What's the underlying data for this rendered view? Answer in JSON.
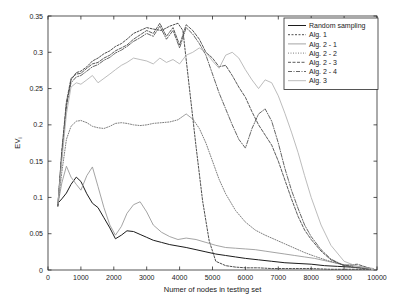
{
  "chart_data": {
    "type": "line",
    "title": "",
    "xlabel": "Numer of nodes in testing set",
    "ylabel": "EV",
    "ylabel_sub": "i",
    "xlim": [
      0,
      10000
    ],
    "ylim": [
      0,
      0.35
    ],
    "xticks": [
      0,
      1000,
      2000,
      3000,
      4000,
      5000,
      6000,
      7000,
      8000,
      9000,
      10000
    ],
    "xtick_labels": [
      "0",
      "1000",
      "2000",
      "3000",
      "4000",
      "5000",
      "6000",
      "7000",
      "8000",
      "9000",
      "10000"
    ],
    "yticks": [
      0,
      0.05,
      0.1,
      0.15,
      0.2,
      0.25,
      0.3,
      0.35
    ],
    "ytick_labels": [
      "0",
      "0.05",
      "0.1",
      "0.15",
      "0.2",
      "0.25",
      "0.3",
      "0.35"
    ],
    "grid": false,
    "legend_position": "top-right",
    "series": [
      {
        "name": "Random sampling",
        "color": "#1c1c1c",
        "dash": "none",
        "width": 1.0,
        "x": [
          300,
          420,
          560,
          700,
          860,
          1000,
          1180,
          1350,
          1520,
          1700,
          1880,
          2050,
          2230,
          2400,
          2600,
          2800,
          3000,
          3200,
          3450,
          3700,
          3950,
          4200,
          4500,
          4800,
          5100,
          5400,
          5700,
          6000,
          6400,
          6800,
          7200,
          7600,
          8000,
          8400,
          8800,
          9200,
          9500,
          9800
        ],
        "y": [
          0.092,
          0.098,
          0.106,
          0.118,
          0.128,
          0.122,
          0.105,
          0.092,
          0.086,
          0.072,
          0.058,
          0.043,
          0.048,
          0.054,
          0.053,
          0.049,
          0.045,
          0.041,
          0.038,
          0.035,
          0.033,
          0.031,
          0.028,
          0.025,
          0.022,
          0.02,
          0.018,
          0.016,
          0.014,
          0.012,
          0.01,
          0.009,
          0.008,
          0.006,
          0.005,
          0.004,
          0.003,
          0.002
        ]
      },
      {
        "name": "Alg. 1",
        "color": "#3a3a3a",
        "dash": "2,1.5",
        "width": 0.9,
        "x": [
          300,
          420,
          560,
          700,
          860,
          1000,
          1180,
          1350,
          1520,
          1700,
          1880,
          2050,
          2230,
          2400,
          2600,
          2800,
          3000,
          3200,
          3450,
          3700,
          3950,
          4100,
          4300,
          4500,
          4700,
          4900,
          5100,
          5400,
          5700,
          6000,
          6400,
          6800,
          7200,
          7600,
          8000,
          8600,
          9200,
          9800
        ],
        "y": [
          0.088,
          0.16,
          0.225,
          0.262,
          0.272,
          0.274,
          0.28,
          0.288,
          0.292,
          0.298,
          0.302,
          0.308,
          0.312,
          0.318,
          0.326,
          0.33,
          0.334,
          0.332,
          0.33,
          0.336,
          0.34,
          0.33,
          0.25,
          0.17,
          0.095,
          0.04,
          0.012,
          0.006,
          0.004,
          0.003,
          0.003,
          0.002,
          0.002,
          0.002,
          0.002,
          0.001,
          0.001,
          0.001
        ]
      },
      {
        "name": "Alg. 2 - 1",
        "color": "#9a9a9a",
        "dash": "none",
        "width": 0.9,
        "x": [
          300,
          420,
          560,
          700,
          860,
          1000,
          1180,
          1350,
          1520,
          1700,
          1880,
          2050,
          2230,
          2400,
          2600,
          2800,
          3000,
          3200,
          3450,
          3700,
          3950,
          4200,
          4500,
          4800,
          5100,
          5400,
          5700,
          6000,
          6300,
          6600,
          6900,
          7200,
          7500,
          7800,
          8100,
          8500,
          8900,
          9300,
          9600,
          9900
        ],
        "y": [
          0.09,
          0.12,
          0.143,
          0.128,
          0.118,
          0.11,
          0.13,
          0.142,
          0.115,
          0.086,
          0.062,
          0.048,
          0.06,
          0.078,
          0.09,
          0.094,
          0.08,
          0.062,
          0.052,
          0.046,
          0.042,
          0.044,
          0.042,
          0.038,
          0.034,
          0.031,
          0.03,
          0.029,
          0.028,
          0.026,
          0.024,
          0.022,
          0.02,
          0.018,
          0.016,
          0.012,
          0.008,
          0.006,
          0.004,
          0.002
        ]
      },
      {
        "name": "Alg. 2 - 2",
        "color": "#6e6e6e",
        "dash": "1,1.5",
        "width": 0.9,
        "x": [
          300,
          420,
          560,
          700,
          860,
          1000,
          1180,
          1350,
          1520,
          1700,
          1880,
          2050,
          2230,
          2400,
          2600,
          2800,
          3000,
          3200,
          3450,
          3700,
          3950,
          4200,
          4400,
          4600,
          4800,
          5000,
          5200,
          5400,
          5700,
          6000,
          6300,
          6600,
          6900,
          7200,
          7500,
          7800,
          8100,
          8500,
          8900,
          9300,
          9700
        ],
        "y": [
          0.089,
          0.135,
          0.18,
          0.198,
          0.205,
          0.206,
          0.203,
          0.198,
          0.196,
          0.195,
          0.198,
          0.202,
          0.203,
          0.202,
          0.2,
          0.199,
          0.2,
          0.202,
          0.203,
          0.204,
          0.207,
          0.215,
          0.208,
          0.195,
          0.175,
          0.15,
          0.125,
          0.105,
          0.082,
          0.066,
          0.055,
          0.048,
          0.042,
          0.036,
          0.03,
          0.024,
          0.019,
          0.013,
          0.008,
          0.004,
          0.002
        ]
      },
      {
        "name": "Alg. 2 - 3",
        "color": "#4a4a4a",
        "dash": "3,1.5",
        "width": 0.9,
        "x": [
          300,
          420,
          560,
          700,
          860,
          1000,
          1180,
          1350,
          1520,
          1700,
          1880,
          2050,
          2230,
          2400,
          2600,
          2800,
          3000,
          3200,
          3400,
          3600,
          3800,
          4000,
          4200,
          4400,
          4600,
          4800,
          5000,
          5200,
          5400,
          5600,
          5800,
          6000,
          6200,
          6400,
          6600,
          6800,
          7000,
          7200,
          7400,
          7600,
          7800,
          8000,
          8300,
          8600,
          9000,
          9400,
          9800
        ],
        "y": [
          0.09,
          0.165,
          0.232,
          0.264,
          0.27,
          0.271,
          0.278,
          0.284,
          0.286,
          0.292,
          0.296,
          0.302,
          0.306,
          0.31,
          0.318,
          0.324,
          0.33,
          0.326,
          0.34,
          0.322,
          0.334,
          0.31,
          0.338,
          0.33,
          0.318,
          0.3,
          0.292,
          0.28,
          0.282,
          0.268,
          0.252,
          0.238,
          0.218,
          0.2,
          0.186,
          0.172,
          0.15,
          0.124,
          0.098,
          0.074,
          0.055,
          0.042,
          0.026,
          0.014,
          0.006,
          0.008,
          0.002
        ]
      },
      {
        "name": "Alg. 2 - 4",
        "color": "#555555",
        "dash": "4,1.5,1,1.5",
        "width": 0.9,
        "x": [
          300,
          420,
          560,
          700,
          860,
          1000,
          1180,
          1350,
          1520,
          1700,
          1880,
          2050,
          2230,
          2400,
          2600,
          2800,
          3000,
          3200,
          3400,
          3600,
          3800,
          4000,
          4200,
          4400,
          4600,
          4800,
          5000,
          5200,
          5400,
          5600,
          5800,
          6000,
          6200,
          6400,
          6600,
          6800,
          7000,
          7200,
          7400,
          7600,
          7800,
          8000,
          8300,
          8600,
          9000,
          9400,
          9800
        ],
        "y": [
          0.088,
          0.158,
          0.228,
          0.258,
          0.266,
          0.268,
          0.274,
          0.28,
          0.283,
          0.289,
          0.293,
          0.299,
          0.303,
          0.308,
          0.315,
          0.32,
          0.326,
          0.322,
          0.336,
          0.318,
          0.33,
          0.306,
          0.334,
          0.325,
          0.312,
          0.296,
          0.27,
          0.244,
          0.222,
          0.2,
          0.18,
          0.168,
          0.195,
          0.215,
          0.222,
          0.205,
          0.175,
          0.14,
          0.11,
          0.085,
          0.062,
          0.046,
          0.028,
          0.015,
          0.006,
          0.003,
          0.001
        ]
      },
      {
        "name": "Alg. 3",
        "color": "#b4b4b4",
        "dash": "none",
        "width": 0.9,
        "x": [
          300,
          420,
          560,
          700,
          860,
          1000,
          1180,
          1350,
          1520,
          1700,
          1880,
          2050,
          2230,
          2400,
          2600,
          2800,
          3000,
          3200,
          3400,
          3600,
          3800,
          4000,
          4200,
          4400,
          4600,
          4800,
          5000,
          5200,
          5400,
          5600,
          5800,
          6000,
          6200,
          6400,
          6600,
          6800,
          7000,
          7200,
          7400,
          7600,
          7800,
          8000,
          8300,
          8600,
          9000,
          9400,
          9800
        ],
        "y": [
          0.091,
          0.15,
          0.215,
          0.252,
          0.258,
          0.256,
          0.262,
          0.268,
          0.258,
          0.264,
          0.27,
          0.276,
          0.282,
          0.286,
          0.292,
          0.29,
          0.288,
          0.284,
          0.292,
          0.286,
          0.29,
          0.284,
          0.296,
          0.3,
          0.306,
          0.3,
          0.288,
          0.278,
          0.296,
          0.3,
          0.292,
          0.276,
          0.262,
          0.25,
          0.262,
          0.258,
          0.24,
          0.216,
          0.19,
          0.162,
          0.13,
          0.1,
          0.062,
          0.034,
          0.012,
          0.005,
          0.002
        ]
      }
    ]
  }
}
